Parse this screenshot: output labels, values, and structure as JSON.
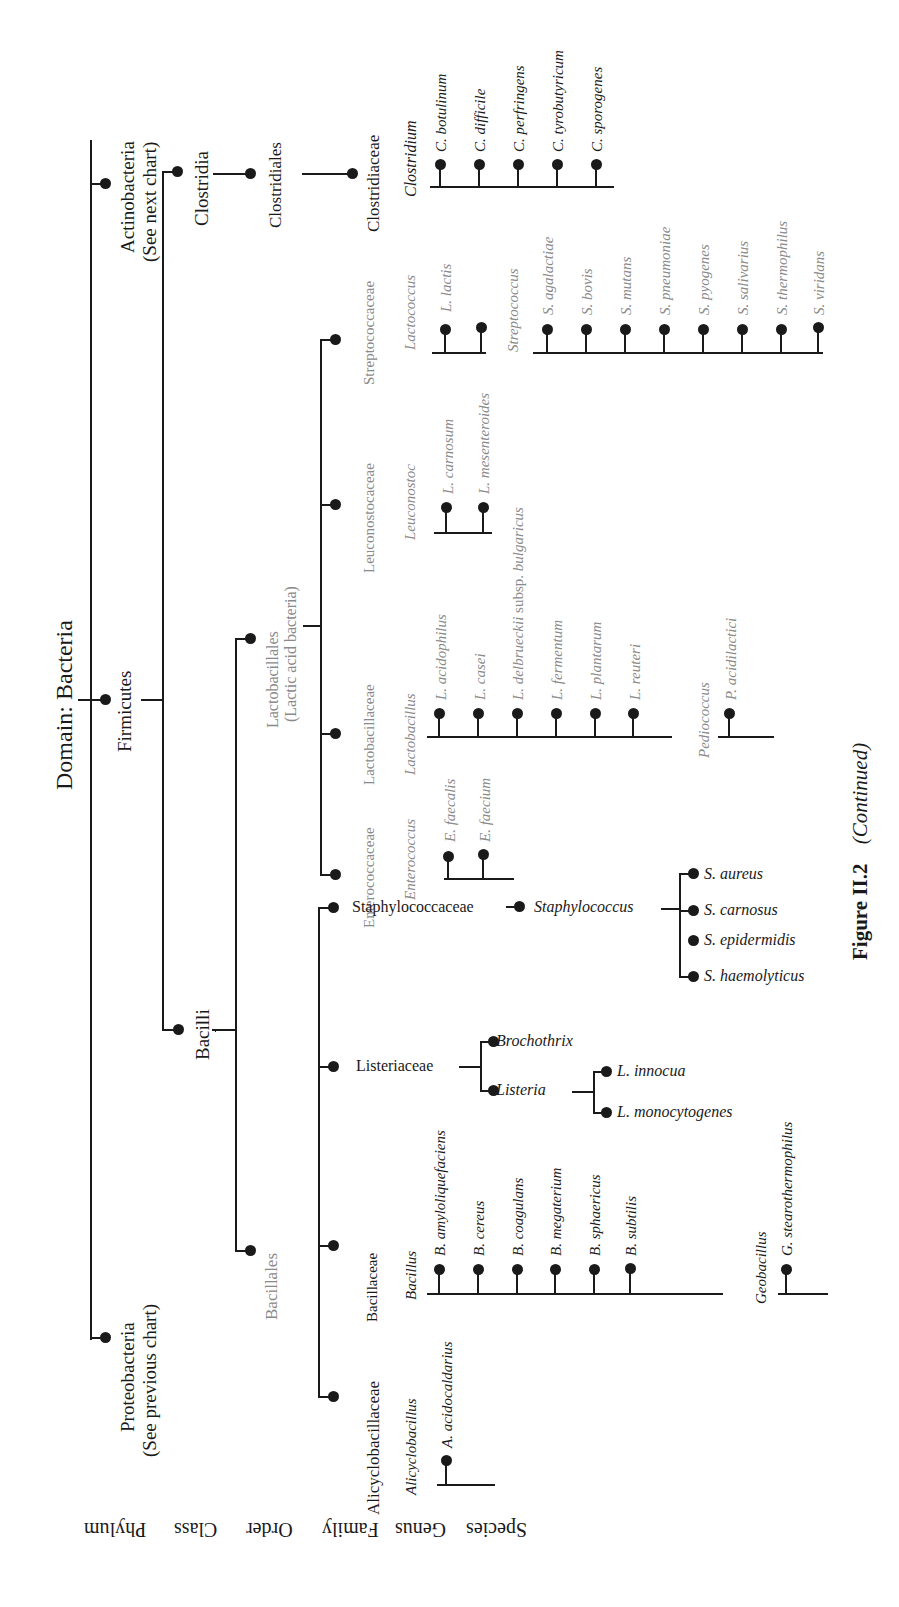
{
  "title": "Domain: Bacteria",
  "caption": {
    "figure": "Figure II.2",
    "note": "(Continued)"
  },
  "rank_labels": [
    "Phylum",
    "Class",
    "Order",
    "Family",
    "Genus",
    "Species"
  ],
  "phyla": {
    "actinobacteria": "Actinobacteria",
    "actinobacteria_note": "(See next chart)",
    "firmicutes": "Firmicutes",
    "proteobacteria": "Proteobacteria",
    "proteobacteria_note": "(See previous chart)"
  },
  "classes": {
    "clostridia": "Clostridia",
    "bacilli": "Bacilli"
  },
  "orders": {
    "clostridiales": "Clostridiales",
    "lactobacillales": "Lactobacillales",
    "lactobacillales_note": "(Lactic acid bacteria)",
    "bacillales": "Bacillales"
  },
  "families": {
    "clostridiaceae": "Clostridiaceae",
    "streptococcaceae": "Streptococcaceae",
    "leuconostocaceae": "Leuconostocaceae",
    "lactobacillaceae": "Lactobacillaceae",
    "enterococcaceae": "Enterococcaceae",
    "staphylococcaceae": "Staphylococcaceae",
    "listeriaceae": "Listeriaceae",
    "bacillaceae": "Bacillaceae",
    "alicyclobacillaceae": "Alicyclobacillaceae"
  },
  "genera": {
    "clostridium": {
      "name": "Clostridium",
      "species": [
        "C. botulinum",
        "C. difficile",
        "C. perfringens",
        "C. tyrobutyricum",
        "C. sporogenes"
      ]
    },
    "lactococcus": {
      "name": "Lactococcus",
      "species": [
        "L. lactis"
      ]
    },
    "streptococcus": {
      "name": "Streptococcus",
      "species": [
        "S. agalactiae",
        "S. bovis",
        "S. mutans",
        "S. pneumoniae",
        "S. pyogenes",
        "S. salivarius",
        "S. thermophilus",
        "S. viridans"
      ]
    },
    "leuconostoc": {
      "name": "Leuconostoc",
      "species": [
        "L. carnosum",
        "L. mesenteroides"
      ]
    },
    "lactobacillus": {
      "name": "Lactobacillus",
      "species": [
        "L. acidophilus",
        "L. casei",
        "L. delbrueckii subsp. bulgaricus",
        "L. fermentum",
        "L. plantarum",
        "L. reuteri"
      ]
    },
    "pediococcus": {
      "name": "Pediococcus",
      "species": [
        "P. acidilactici"
      ]
    },
    "enterococcus": {
      "name": "Enterococcus",
      "species": [
        "E. faecalis",
        "E. faecium"
      ]
    },
    "staphylococcus": {
      "name": "Staphylococcus",
      "species": [
        "S. aureus",
        "S. carnosus",
        "S. epidermidis",
        "S. haemolyticus"
      ]
    },
    "brochothrix": {
      "name": "Brochothrix"
    },
    "listeria": {
      "name": "Listeria",
      "species": [
        "L. innocua",
        "L. monocytogenes"
      ]
    },
    "bacillus": {
      "name": "Bacillus",
      "species": [
        "B. amyloliquefaciens",
        "B. cereus",
        "B. coagulans",
        "B. megaterium",
        "B. sphaericus",
        "B. subtilis"
      ]
    },
    "geobacillus": {
      "name": "Geobacillus",
      "species": [
        "G. stearothermophilus"
      ]
    },
    "alicyclobacillus": {
      "name": "Alicyclobacillus",
      "species": [
        "A. acidocaldarius"
      ]
    }
  },
  "delbrueckii_parts": {
    "italic": "L. delbrueckii",
    "plain": " subsp. ",
    "italic2": "bulgaricus"
  }
}
